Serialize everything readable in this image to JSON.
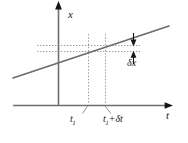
{
  "figure": {
    "kind": "line-graph-diagram",
    "background_color": "#ffffff",
    "axis_color": "#5a5a5a",
    "line_color": "#6b6b6b",
    "dotted_color": "#9a9a9a",
    "arrow_color": "#141414",
    "text_color": "#1a1a1a"
  },
  "axes": {
    "vertical": {
      "label": "x",
      "name": "x-axis",
      "x_px": 58,
      "top_px": 4,
      "bottom_px": 106
    },
    "horizontal": {
      "label": "t",
      "name": "t-axis",
      "y_px": 105,
      "left_px": 13,
      "right_px": 172
    }
  },
  "curve": {
    "name": "straight-line",
    "x1_px": 13,
    "y1_px": 78,
    "x2_px": 169,
    "y2_px": 26
  },
  "ticks": [
    {
      "id": "t1",
      "label_main": "t",
      "label_sub": "1",
      "label_op": "",
      "label_extra": "",
      "x_px": 88
    },
    {
      "id": "t1-plus-dt",
      "label_main": "t",
      "label_sub": "1",
      "label_op": "+",
      "label_extra": "δt",
      "x_px": 105
    }
  ],
  "guides": {
    "vertical_dotted": [
      88,
      105
    ],
    "horizontal_dotted_y": [
      45,
      51
    ],
    "horizontal_dotted_left_px": 37,
    "horizontal_dotted_right_px": 140
  },
  "annotations": {
    "delta_x": {
      "label": "δx",
      "arrow_x_px": 133,
      "arrow_top_px": 36,
      "arrow_bottom_px": 56
    },
    "delta_t": {
      "label": "δt"
    }
  },
  "labels": {
    "x_axis": "x",
    "t_axis": "t",
    "delta_x": "δx",
    "t1_main": "t",
    "t1_sub": "1",
    "t1dt_main": "t",
    "t1dt_sub": "1",
    "t1dt_op": "+",
    "t1dt_delta": "δt"
  }
}
